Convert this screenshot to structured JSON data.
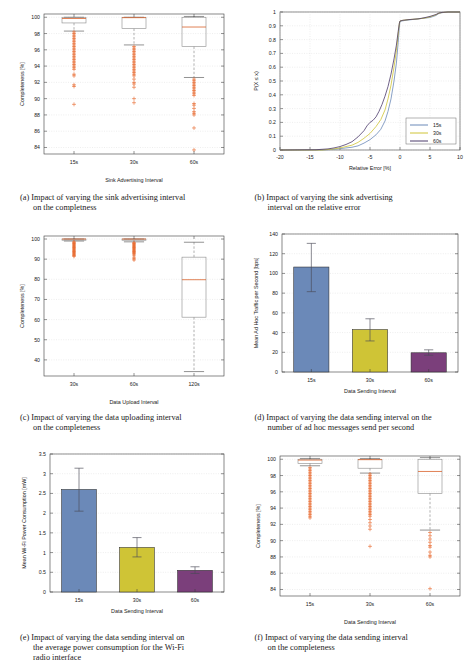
{
  "figure": {
    "panels": [
      "a",
      "b",
      "c",
      "d",
      "e",
      "f"
    ]
  },
  "captions": {
    "a": {
      "label": "(a)",
      "line1": "Impact of varying the sink advertising interval",
      "line2": "on the completness"
    },
    "b": {
      "label": "(b)",
      "line1": "Impact of varying the sink advertising",
      "line2": "interval on the relative error"
    },
    "c": {
      "label": "(c)",
      "line1": "Impact of varying the data uploading interval",
      "line2": "on the completeness"
    },
    "d": {
      "label": "(d)",
      "line1": "Impact of varying the data sending interval on the",
      "line2": "number of ad hoc messages send per second"
    },
    "e": {
      "label": "(e)",
      "line1": "Impact of varying the data sending interval on",
      "line2": "the average power consumption for the Wi-Fi",
      "line3": "radio interface"
    },
    "f": {
      "label": "(f)",
      "line1": "Impact of varying the data sending interval",
      "line2": "on the completeness"
    }
  },
  "colors": {
    "blue": "#6b89b8",
    "yellow": "#cfc436",
    "purple": "#7b3f7b",
    "orange": "#e8662a",
    "box_stroke": "#8a8a8a",
    "axis": "#3b3b3b",
    "grid": "#d8d8d8",
    "curve_60s": "#4b3a6b"
  },
  "chart_data": [
    {
      "id": "a",
      "type": "box",
      "title": "",
      "xlabel": "Sink Advertising Interval",
      "ylabel": "Completeness [%]",
      "categories": [
        "15s",
        "30s",
        "60s"
      ],
      "xtick_labels": [
        "15s",
        "30s",
        "60s"
      ],
      "ytick_labels": [
        "84",
        "86",
        "88",
        "90",
        "92",
        "94",
        "96",
        "98",
        "100"
      ],
      "ylim": [
        83.2,
        100.4
      ],
      "grid": true,
      "boxes": [
        {
          "name": "15s",
          "q1": 99.3,
          "median": 99.85,
          "q3": 100.0,
          "whisker_low": 98.3,
          "whisker_high": 100.0,
          "outliers": [
            98.2,
            98.0,
            97.8,
            97.6,
            97.4,
            97.2,
            97.0,
            96.8,
            96.6,
            96.4,
            96.2,
            96.0,
            95.8,
            95.6,
            95.4,
            95.2,
            95.0,
            94.8,
            94.6,
            94.4,
            94.2,
            94.0,
            93.8,
            93.6,
            93.0,
            92.8,
            91.7,
            91.5,
            89.3
          ]
        },
        {
          "name": "30s",
          "q1": 98.6,
          "median": 99.95,
          "q3": 100.0,
          "whisker_low": 96.6,
          "whisker_high": 100.0,
          "outliers": [
            96.4,
            96.2,
            96.0,
            95.8,
            95.6,
            95.4,
            95.2,
            95.0,
            94.8,
            94.6,
            94.4,
            94.2,
            94.0,
            93.8,
            93.6,
            93.4,
            93.2,
            93.0,
            92.8,
            92.4,
            92.0,
            91.8,
            91.4,
            90.0,
            89.5
          ]
        },
        {
          "name": "60s",
          "q1": 96.4,
          "median": 98.8,
          "q3": 100.0,
          "whisker_low": 92.6,
          "whisker_high": 100.1,
          "outliers": [
            92.4,
            92.2,
            92.0,
            91.8,
            91.6,
            91.4,
            91.2,
            91.0,
            90.8,
            90.6,
            90.4,
            89.4,
            89.2,
            88.8,
            88.4,
            88.2,
            88.0,
            86.4,
            83.7
          ]
        }
      ]
    },
    {
      "id": "b",
      "type": "line",
      "title": "",
      "xlabel": "Relative Error [%]",
      "ylabel": "P(X ≤ x)",
      "xtick_labels": [
        "-20",
        "-15",
        "-10",
        "-5",
        "0",
        "5",
        "10"
      ],
      "ytick_labels": [
        "0",
        "0.1",
        "0.2",
        "0.3",
        "0.4",
        "0.5",
        "0.6",
        "0.7",
        "0.8",
        "0.9",
        "1"
      ],
      "xlim": [
        -20,
        10
      ],
      "ylim": [
        0,
        1
      ],
      "grid": true,
      "legend_position": "lower-right",
      "series": [
        {
          "name": "15s",
          "color": "#6b89b8",
          "x": [
            -20,
            -13,
            -11,
            -10,
            -9,
            -8,
            -7,
            -6,
            -5,
            -4,
            -3.2,
            -2.5,
            -2,
            -1.5,
            -1,
            -0.6,
            -0.3,
            -0.1,
            0,
            0.3,
            1,
            2,
            3,
            4,
            5,
            6,
            6.5,
            7,
            8,
            10
          ],
          "y": [
            0,
            0,
            0.005,
            0.01,
            0.015,
            0.02,
            0.03,
            0.05,
            0.075,
            0.11,
            0.15,
            0.21,
            0.28,
            0.37,
            0.5,
            0.63,
            0.78,
            0.9,
            0.93,
            0.935,
            0.94,
            0.945,
            0.95,
            0.955,
            0.96,
            0.975,
            0.99,
            0.995,
            1,
            1
          ]
        },
        {
          "name": "30s",
          "color": "#cfc436",
          "x": [
            -20,
            -13,
            -11,
            -10,
            -9,
            -8,
            -7,
            -6,
            -5,
            -4,
            -3.2,
            -2.5,
            -2,
            -1.5,
            -1,
            -0.6,
            -0.3,
            -0.1,
            0,
            0.5,
            1.5,
            3,
            4,
            5,
            6,
            6.5,
            7,
            8,
            10
          ],
          "y": [
            0,
            0,
            0.008,
            0.015,
            0.025,
            0.035,
            0.055,
            0.085,
            0.12,
            0.17,
            0.22,
            0.29,
            0.37,
            0.47,
            0.6,
            0.72,
            0.84,
            0.92,
            0.935,
            0.94,
            0.945,
            0.95,
            0.955,
            0.965,
            0.98,
            0.992,
            0.996,
            1,
            1
          ]
        },
        {
          "name": "60s",
          "color": "#4b3a6b",
          "x": [
            -20,
            -14,
            -12,
            -11,
            -10,
            -9,
            -8,
            -7,
            -6,
            -5.5,
            -5,
            -4.5,
            -4,
            -3.5,
            -3,
            -2.5,
            -2,
            -1.5,
            -1,
            -0.6,
            -0.3,
            -0.1,
            0,
            0.5,
            1.5,
            3,
            4,
            5,
            6,
            6.5,
            7,
            8,
            10
          ],
          "y": [
            0,
            0.002,
            0.008,
            0.015,
            0.025,
            0.04,
            0.06,
            0.095,
            0.14,
            0.175,
            0.2,
            0.215,
            0.24,
            0.28,
            0.33,
            0.39,
            0.46,
            0.55,
            0.66,
            0.76,
            0.86,
            0.92,
            0.935,
            0.94,
            0.945,
            0.95,
            0.958,
            0.968,
            0.982,
            0.993,
            0.997,
            1,
            1
          ]
        }
      ],
      "legend": [
        {
          "label": "15s",
          "color": "#6b89b8"
        },
        {
          "label": "30s",
          "color": "#cfc436"
        },
        {
          "label": "60s",
          "color": "#4b3a6b"
        }
      ]
    },
    {
      "id": "c",
      "type": "box",
      "title": "",
      "xlabel": "Data Upload Interval",
      "ylabel": "Completeness [%]",
      "categories": [
        "30s",
        "60s",
        "120s"
      ],
      "xtick_labels": [
        "30s",
        "60s",
        "120s"
      ],
      "ytick_labels": [
        "40",
        "50",
        "60",
        "70",
        "80",
        "90",
        "100"
      ],
      "ylim": [
        32,
        101.5
      ],
      "grid": true,
      "boxes": [
        {
          "name": "30s",
          "q1": 99.6,
          "median": 100.0,
          "q3": 100.0,
          "whisker_low": 99.0,
          "whisker_high": 100.0,
          "outliers": [
            98.6,
            98.2,
            97.8,
            97.4,
            97.0,
            96.6,
            96.2,
            95.8,
            95.4,
            95.0,
            94.6,
            94.2,
            93.8,
            93.4,
            93.0,
            92.6,
            92.2,
            91.8,
            91.4
          ]
        },
        {
          "name": "60s",
          "q1": 99.4,
          "median": 100.0,
          "q3": 100.0,
          "whisker_low": 98.6,
          "whisker_high": 100.0,
          "outliers": [
            98.2,
            97.8,
            97.4,
            97.0,
            96.6,
            96.2,
            95.8,
            95.4,
            95.0,
            94.6,
            94.2,
            93.8,
            93.4,
            93.0,
            92.6,
            92.0,
            91.0,
            90.2,
            89.6
          ]
        },
        {
          "name": "120s",
          "q1": 61.2,
          "median": 79.8,
          "q3": 91.0,
          "whisker_low": 34.2,
          "whisker_high": 98.4,
          "outliers": []
        }
      ]
    },
    {
      "id": "d",
      "type": "bar",
      "title": "",
      "xlabel": "Data Sending Interval",
      "ylabel": "Mean Ad Hoc Traffic per Second [bps]",
      "categories": [
        "15s",
        "30s",
        "60s"
      ],
      "values": [
        106.5,
        43.0,
        19.5
      ],
      "errors_low": [
        81.5,
        31.5,
        17.0
      ],
      "errors_high": [
        130.5,
        54.0,
        22.5
      ],
      "bar_colors": [
        "#6b89b8",
        "#cfc436",
        "#7b3f7b"
      ],
      "ytick_labels": [
        "0",
        "20",
        "40",
        "60",
        "80",
        "100",
        "120",
        "140"
      ],
      "ylim": [
        0,
        140
      ],
      "grid": true
    },
    {
      "id": "e",
      "type": "bar",
      "title": "",
      "xlabel": "Data Sending Interval",
      "ylabel": "Mean Wi-Fi Power Consumption [mW]",
      "categories": [
        "15s",
        "30s",
        "60s"
      ],
      "values": [
        2.6,
        1.13,
        0.55
      ],
      "errors_low": [
        2.05,
        0.89,
        0.47
      ],
      "errors_high": [
        3.14,
        1.38,
        0.64
      ],
      "bar_colors": [
        "#6b89b8",
        "#cfc436",
        "#7b3f7b"
      ],
      "ytick_labels": [
        "0",
        "0.5",
        "1",
        "1.5",
        "2",
        "2.5",
        "3",
        "3.5"
      ],
      "ylim": [
        0,
        3.5
      ],
      "grid": true
    },
    {
      "id": "f",
      "type": "box",
      "title": "",
      "xlabel": "Data Sending Interval",
      "ylabel": "Completeness [%]",
      "categories": [
        "15s",
        "30s",
        "60s"
      ],
      "xtick_labels": [
        "15s",
        "30s",
        "60s"
      ],
      "ytick_labels": [
        "84",
        "86",
        "88",
        "90",
        "92",
        "94",
        "96",
        "98",
        "100"
      ],
      "ylim": [
        83.2,
        100.4
      ],
      "grid": true,
      "boxes": [
        {
          "name": "15s",
          "q1": 99.5,
          "median": 99.9,
          "q3": 100.0,
          "whisker_low": 99.2,
          "whisker_high": 100.1,
          "outliers": [
            99.0,
            98.8,
            98.6,
            98.4,
            98.2,
            98.0,
            97.8,
            97.6,
            97.4,
            97.2,
            97.0,
            96.8,
            96.6,
            96.4,
            96.2,
            96.0,
            95.8,
            95.6,
            95.4,
            95.2,
            95.0,
            94.8,
            94.6,
            94.4,
            94.2,
            94.0,
            93.8,
            93.6,
            93.4,
            93.2,
            93.0,
            92.8
          ]
        },
        {
          "name": "30s",
          "q1": 98.9,
          "median": 99.95,
          "q3": 100.0,
          "whisker_low": 98.3,
          "whisker_high": 100.1,
          "outliers": [
            98.2,
            98.0,
            97.8,
            97.6,
            97.4,
            97.2,
            97.0,
            96.8,
            96.6,
            96.4,
            96.2,
            96.0,
            95.8,
            95.6,
            95.4,
            95.2,
            95.0,
            94.8,
            94.6,
            94.4,
            94.2,
            94.0,
            93.8,
            93.6,
            93.4,
            93.2,
            93.0,
            92.6,
            92.2,
            91.8,
            91.4,
            89.3
          ]
        },
        {
          "name": "60s",
          "q1": 95.8,
          "median": 98.5,
          "q3": 100.0,
          "whisker_low": 91.3,
          "whisker_high": 100.2,
          "outliers": [
            91.0,
            90.6,
            90.2,
            89.8,
            89.4,
            89.2,
            88.6,
            88.2,
            88.0,
            84.1
          ]
        }
      ]
    }
  ]
}
